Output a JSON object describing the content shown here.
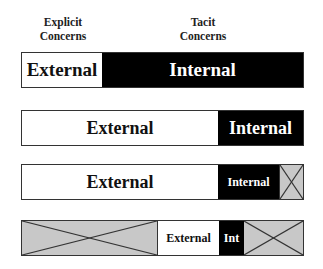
{
  "headers": {
    "explicit": {
      "line1": "Explicit",
      "line2": "Concerns"
    },
    "tacit": {
      "line1": "Tacit",
      "line2": "Concerns"
    }
  },
  "colors": {
    "external": "#ffffff",
    "internal": "#000000",
    "not_applicable": "#c8c8c8",
    "border": "#333333"
  },
  "bars": [
    {
      "segments": [
        {
          "type": "external",
          "label": "External",
          "width": 80,
          "font_size": 19
        },
        {
          "type": "internal",
          "label": "Internal",
          "width": 203,
          "font_size": 19
        }
      ]
    },
    {
      "segments": [
        {
          "type": "external",
          "label": "External",
          "width": 197,
          "font_size": 18
        },
        {
          "type": "internal",
          "label": "Internal",
          "width": 86,
          "font_size": 18
        }
      ]
    },
    {
      "segments": [
        {
          "type": "external",
          "label": "External",
          "width": 197,
          "font_size": 18
        },
        {
          "type": "internal",
          "label": "Internal",
          "width": 61,
          "font_size": 12
        },
        {
          "type": "not_applicable",
          "label": "",
          "width": 25
        }
      ]
    },
    {
      "segments": [
        {
          "type": "not_applicable",
          "label": "",
          "width": 135
        },
        {
          "type": "external",
          "label": "External",
          "width": 62,
          "font_size": 12
        },
        {
          "type": "internal",
          "label": "Int",
          "width": 25,
          "font_size": 12
        },
        {
          "type": "not_applicable",
          "label": "",
          "width": 61
        }
      ]
    }
  ]
}
